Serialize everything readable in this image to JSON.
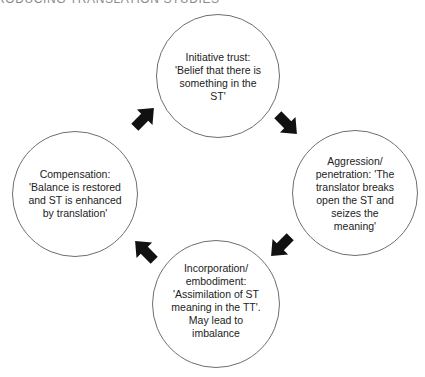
{
  "page": {
    "running_head": "RODUCING TRANSLATION STUDIES"
  },
  "diagram": {
    "type": "cycle",
    "nodes": [
      {
        "id": "top",
        "label": "Initiative trust:\n'Belief that there is\nsomething in the\nST'"
      },
      {
        "id": "right",
        "label": "Aggression/\npenetration: 'The\ntranslator breaks\nopen the ST and\nseizes the\nmeaning'"
      },
      {
        "id": "bottom",
        "label": "Incorporation/\nembodiment:\n'Assimilation of ST\nmeaning in the TT'.\nMay lead to\nimbalance"
      },
      {
        "id": "left",
        "label": "Compensation:\n'Balance is restored\nand ST is enhanced\nby translation'"
      }
    ],
    "edges": [
      {
        "from": "top",
        "to": "right",
        "direction": "down-right"
      },
      {
        "from": "right",
        "to": "bottom",
        "direction": "down-left"
      },
      {
        "from": "bottom",
        "to": "left",
        "direction": "up-left"
      },
      {
        "from": "left",
        "to": "top",
        "direction": "up-right"
      }
    ],
    "colors": {
      "circle_stroke": "#6e6e6e",
      "arrow_fill": "#111111",
      "text": "#222222"
    }
  }
}
